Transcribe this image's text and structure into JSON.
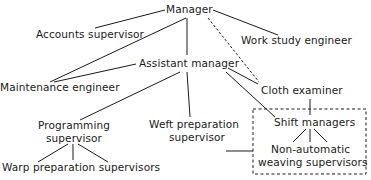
{
  "diagram": {
    "type": "organization-chart",
    "colors": {
      "ink": "#1a1a1a",
      "background": "#ffffff"
    },
    "nodes": {
      "manager": {
        "label": "Manager"
      },
      "accounts_supervisor": {
        "label": "Accounts supervisor"
      },
      "work_study_engineer": {
        "label": "Work study engineer"
      },
      "assistant_manager": {
        "label": "Assistant manager"
      },
      "maintenance_engineer": {
        "label": "Maintenance engineer"
      },
      "cloth_examiner": {
        "label": "Cloth examiner"
      },
      "programming_supervisor": {
        "lines": [
          "Programming",
          "supervisor"
        ]
      },
      "weft_preparation_supervisor": {
        "lines": [
          "Weft preparation",
          "supervisor"
        ]
      },
      "shift_managers": {
        "label": "Shift managers"
      },
      "non_automatic_weaving_supervisors": {
        "lines": [
          "Non-automatic",
          "weaving supervisors"
        ]
      },
      "warp_preparation_supervisors": {
        "label": "Warp preparation supervisors"
      }
    },
    "edges": [
      {
        "from": "manager",
        "to": "accounts_supervisor",
        "style": "solid"
      },
      {
        "from": "manager",
        "to": "work_study_engineer",
        "style": "solid"
      },
      {
        "from": "manager",
        "to": "maintenance_engineer",
        "style": "solid"
      },
      {
        "from": "manager",
        "to": "assistant_manager",
        "style": "solid"
      },
      {
        "from": "manager",
        "to": "cloth_examiner",
        "style": "dashed"
      },
      {
        "from": "assistant_manager",
        "to": "maintenance_engineer",
        "style": "solid"
      },
      {
        "from": "assistant_manager",
        "to": "programming_supervisor",
        "style": "solid"
      },
      {
        "from": "assistant_manager",
        "to": "weft_preparation_supervisor",
        "style": "solid"
      },
      {
        "from": "assistant_manager",
        "to": "cloth_examiner",
        "style": "solid"
      },
      {
        "from": "assistant_manager",
        "to": "shift_managers",
        "style": "solid"
      },
      {
        "from": "cloth_examiner",
        "to": "shift_managers",
        "style": "solid"
      },
      {
        "from": "weft_preparation_supervisor",
        "to": "shift_group",
        "style": "solid"
      },
      {
        "from": "shift_managers",
        "to": "non_automatic_weaving_supervisors",
        "style": "solid"
      },
      {
        "from": "programming_supervisor",
        "to": "warp_preparation_supervisors",
        "style": "solid"
      }
    ],
    "groups": [
      {
        "id": "shift_group",
        "members": [
          "shift_managers",
          "non_automatic_weaving_supervisors"
        ],
        "border": "dashed"
      }
    ]
  }
}
